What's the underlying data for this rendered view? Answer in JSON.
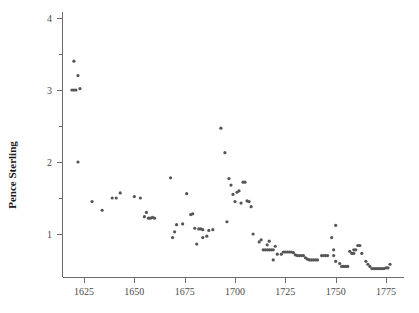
{
  "chart_data": {
    "type": "scatter",
    "title": "",
    "xlabel": "",
    "ylabel": "Pence Sterling",
    "xlim": [
      1617,
      1782
    ],
    "ylim": [
      0.25,
      4.15
    ],
    "grid": false,
    "legend": null,
    "x_ticks": [
      1625,
      1650,
      1675,
      1700,
      1725,
      1750,
      1775
    ],
    "x_tick_labels": [
      "1625",
      "1650",
      "1675",
      "1700",
      "1725",
      "1750",
      "1775"
    ],
    "y_ticks": [
      1,
      2,
      3,
      4
    ],
    "y_tick_labels": [
      "1",
      "2",
      "3",
      "4"
    ],
    "y_minor_ticks": [
      1.5,
      2.5,
      3.5
    ],
    "marker": "dot",
    "marker_color": "#555555",
    "marker_size": 1.6,
    "series": [
      {
        "name": "Price of silver in pence sterling",
        "points": [
          [
            1620,
            3.4
          ],
          [
            1622,
            3.2
          ],
          [
            1619,
            3.0
          ],
          [
            1620,
            3.0
          ],
          [
            1621,
            3.0
          ],
          [
            1623,
            3.02
          ],
          [
            1622,
            2.0
          ],
          [
            1629,
            1.45
          ],
          [
            1634,
            1.33
          ],
          [
            1639,
            1.5
          ],
          [
            1641,
            1.5
          ],
          [
            1643,
            1.57
          ],
          [
            1650,
            1.52
          ],
          [
            1653,
            1.5
          ],
          [
            1656,
            1.3
          ],
          [
            1655,
            1.24
          ],
          [
            1657,
            1.22
          ],
          [
            1658,
            1.22
          ],
          [
            1659,
            1.23
          ],
          [
            1660,
            1.22
          ],
          [
            1668,
            1.78
          ],
          [
            1670,
            1.03
          ],
          [
            1669,
            0.95
          ],
          [
            1671,
            1.13
          ],
          [
            1674,
            1.14
          ],
          [
            1676,
            1.56
          ],
          [
            1678,
            1.27
          ],
          [
            1679,
            1.28
          ],
          [
            1680,
            1.08
          ],
          [
            1682,
            1.07
          ],
          [
            1683,
            1.07
          ],
          [
            1684,
            1.06
          ],
          [
            1681,
            0.86
          ],
          [
            1686,
            0.97
          ],
          [
            1687,
            1.05
          ],
          [
            1689,
            1.06
          ],
          [
            1684,
            0.95
          ],
          [
            1693,
            2.47
          ],
          [
            1695,
            2.13
          ],
          [
            1697,
            1.77
          ],
          [
            1698,
            1.68
          ],
          [
            1699,
            1.55
          ],
          [
            1701,
            1.58
          ],
          [
            1702,
            1.6
          ],
          [
            1700,
            1.45
          ],
          [
            1704,
            1.72
          ],
          [
            1705,
            1.72
          ],
          [
            1703,
            1.43
          ],
          [
            1706,
            1.46
          ],
          [
            1707,
            1.45
          ],
          [
            1708,
            1.38
          ],
          [
            1696,
            1.17
          ],
          [
            1709,
            1.0
          ],
          [
            1712,
            0.89
          ],
          [
            1714,
            0.78
          ],
          [
            1715,
            0.78
          ],
          [
            1716,
            0.78
          ],
          [
            1717,
            0.78
          ],
          [
            1718,
            0.78
          ],
          [
            1719,
            0.78
          ],
          [
            1713,
            0.92
          ],
          [
            1716,
            0.85
          ],
          [
            1717,
            0.9
          ],
          [
            1720,
            0.83
          ],
          [
            1721,
            0.72
          ],
          [
            1719,
            0.64
          ],
          [
            1723,
            0.72
          ],
          [
            1724,
            0.75
          ],
          [
            1725,
            0.75
          ],
          [
            1726,
            0.75
          ],
          [
            1727,
            0.75
          ],
          [
            1728,
            0.75
          ],
          [
            1729,
            0.74
          ],
          [
            1730,
            0.71
          ],
          [
            1731,
            0.7
          ],
          [
            1732,
            0.7
          ],
          [
            1733,
            0.7
          ],
          [
            1734,
            0.7
          ],
          [
            1735,
            0.67
          ],
          [
            1736,
            0.65
          ],
          [
            1737,
            0.64
          ],
          [
            1738,
            0.64
          ],
          [
            1739,
            0.64
          ],
          [
            1740,
            0.64
          ],
          [
            1741,
            0.64
          ],
          [
            1743,
            0.7
          ],
          [
            1744,
            0.7
          ],
          [
            1745,
            0.7
          ],
          [
            1746,
            0.7
          ],
          [
            1748,
            0.95
          ],
          [
            1749,
            0.78
          ],
          [
            1750,
            1.12
          ],
          [
            1749,
            0.7
          ],
          [
            1750,
            0.62
          ],
          [
            1752,
            0.59
          ],
          [
            1753,
            0.55
          ],
          [
            1754,
            0.55
          ],
          [
            1755,
            0.55
          ],
          [
            1756,
            0.55
          ],
          [
            1757,
            0.76
          ],
          [
            1759,
            0.78
          ],
          [
            1760,
            0.78
          ],
          [
            1758,
            0.73
          ],
          [
            1759,
            0.73
          ],
          [
            1761,
            0.84
          ],
          [
            1762,
            0.84
          ],
          [
            1763,
            0.73
          ],
          [
            1765,
            0.62
          ],
          [
            1766,
            0.58
          ],
          [
            1767,
            0.55
          ],
          [
            1768,
            0.52
          ],
          [
            1769,
            0.52
          ],
          [
            1770,
            0.52
          ],
          [
            1771,
            0.52
          ],
          [
            1772,
            0.52
          ],
          [
            1773,
            0.52
          ],
          [
            1774,
            0.52
          ],
          [
            1775,
            0.53
          ],
          [
            1776,
            0.53
          ],
          [
            1777,
            0.58
          ]
        ]
      }
    ]
  },
  "axes": {
    "y_title": "Pence Sterling"
  }
}
